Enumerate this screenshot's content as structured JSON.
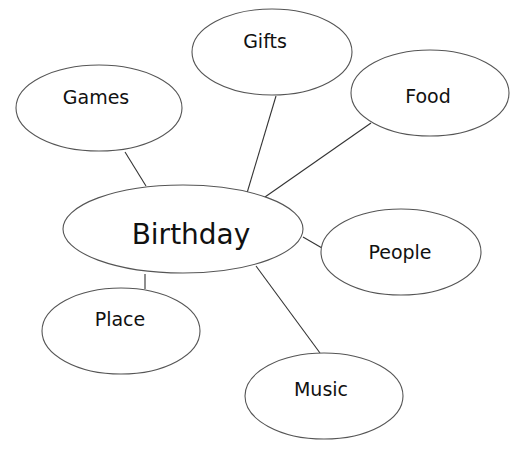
{
  "diagram": {
    "type": "mind-map",
    "center": {
      "id": "birthday",
      "label": "Birthday",
      "cx": 183,
      "cy": 229,
      "rx": 120,
      "ry": 44,
      "label_x": 191,
      "label_y": 236
    },
    "nodes": [
      {
        "id": "games",
        "label": "Games",
        "cx": 99,
        "cy": 108,
        "rx": 83,
        "ry": 43,
        "label_x": 96,
        "label_y": 98
      },
      {
        "id": "gifts",
        "label": "Gifts",
        "cx": 272,
        "cy": 52,
        "rx": 80,
        "ry": 43,
        "label_x": 265,
        "label_y": 42
      },
      {
        "id": "food",
        "label": "Food",
        "cx": 430,
        "cy": 93,
        "rx": 79,
        "ry": 43,
        "label_x": 428,
        "label_y": 97
      },
      {
        "id": "people",
        "label": "People",
        "cx": 401,
        "cy": 252,
        "rx": 80,
        "ry": 43,
        "label_x": 400,
        "label_y": 253
      },
      {
        "id": "place",
        "label": "Place",
        "cx": 121,
        "cy": 331,
        "rx": 79,
        "ry": 43,
        "label_x": 120,
        "label_y": 320
      },
      {
        "id": "music",
        "label": "Music",
        "cx": 324,
        "cy": 396,
        "rx": 79,
        "ry": 43,
        "label_x": 321,
        "label_y": 390
      }
    ],
    "edges": [
      {
        "from": "games",
        "to": "birthday",
        "x1": 125,
        "y1": 152,
        "x2": 146,
        "y2": 186
      },
      {
        "from": "gifts",
        "to": "birthday",
        "x1": 276,
        "y1": 96,
        "x2": 247,
        "y2": 193
      },
      {
        "from": "food",
        "to": "birthday",
        "x1": 371,
        "y1": 123,
        "x2": 265,
        "y2": 197
      },
      {
        "from": "birthday",
        "to": "people",
        "x1": 303,
        "y1": 237,
        "x2": 322,
        "y2": 248
      },
      {
        "from": "birthday",
        "to": "place",
        "x1": 145,
        "y1": 274,
        "x2": 145,
        "y2": 289
      },
      {
        "from": "birthday",
        "to": "music",
        "x1": 256,
        "y1": 266,
        "x2": 320,
        "y2": 353
      }
    ],
    "colors": {
      "background": "#ffffff",
      "stroke": "#555555",
      "text": "#111111"
    }
  }
}
